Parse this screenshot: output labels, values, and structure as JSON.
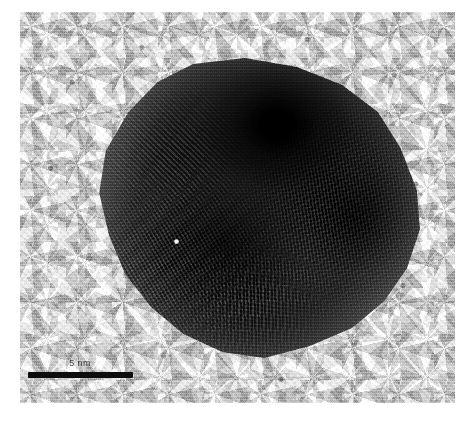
{
  "figure": {
    "type": "hrtem-micrograph",
    "modality": "High-resolution transmission electron microscopy (HRTEM)",
    "background_color": "#d4d4d4",
    "page_color": "#ffffff",
    "particle_color": "#2e2e2e"
  },
  "scale_bar": {
    "label": "5 nm",
    "value": 5,
    "unit": "nm",
    "bar_length_px": 105,
    "bar_color": "#0d0d0d",
    "position": "bottom-left"
  },
  "micrograph": {
    "frame": {
      "left": 20,
      "top": 12,
      "width": 435,
      "height": 391
    },
    "particle": {
      "center_x": 238,
      "center_y": 208,
      "width_px": 324,
      "height_px": 300,
      "approx_diameter_nm": 15,
      "shape": "quasi-spherical faceted",
      "lattice_domains": [
        {
          "name": "lower-left cross-hatch",
          "fringe_angles_deg": [
            62,
            -30
          ]
        },
        {
          "name": "right fine diagonal",
          "fringe_angles_deg": [
            78,
            -14
          ]
        },
        {
          "name": "upper-left steep",
          "fringe_angles_deg": [
            44
          ]
        },
        {
          "name": "bottom-center vertical",
          "fringe_angles_deg": [
            88,
            8
          ]
        }
      ],
      "features": [
        {
          "name": "dark contrast cap",
          "location": "top-center"
        },
        {
          "name": "bright defect spot",
          "location": "left-of-center",
          "x": 153,
          "y": 238
        }
      ]
    },
    "support_film": {
      "material": "amorphous carbon",
      "texture": "mottled speckle granularity"
    }
  }
}
